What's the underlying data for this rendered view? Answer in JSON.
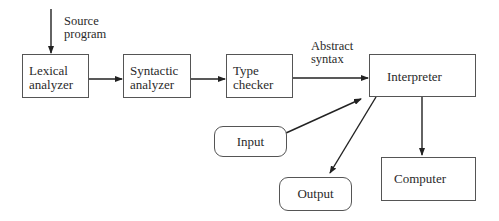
{
  "diagram": {
    "source_label": [
      "Source",
      "program"
    ],
    "abstract_label": [
      "Abstract",
      "syntax"
    ],
    "nodes": {
      "lexical": [
        "Lexical",
        "analyzer"
      ],
      "syntactic": [
        "Syntactic",
        "analyzer"
      ],
      "type_checker": [
        "Type",
        "checker"
      ],
      "interpreter": "Interpreter",
      "input": "Input",
      "output": "Output",
      "computer": "Computer"
    },
    "edges": [
      {
        "from": "source",
        "to": "lexical"
      },
      {
        "from": "lexical",
        "to": "syntactic"
      },
      {
        "from": "syntactic",
        "to": "type_checker"
      },
      {
        "from": "type_checker",
        "to": "interpreter",
        "label": "Abstract syntax"
      },
      {
        "from": "input",
        "to": "interpreter"
      },
      {
        "from": "interpreter",
        "to": "output"
      },
      {
        "from": "interpreter",
        "to": "computer"
      }
    ],
    "colors": {
      "stroke": "#333333",
      "text": "#2a2a2a",
      "background": "#ffffff"
    }
  }
}
